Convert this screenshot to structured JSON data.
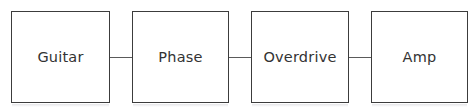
{
  "diagram": {
    "type": "signal-chain-flowchart",
    "canvas": {
      "width": 476,
      "height": 110,
      "background": "#ffffff"
    },
    "style": {
      "box_border_color": "#3c3c3c",
      "box_fill_color": "#ffffff",
      "connector_color": "#5a5a5a",
      "label_color": "#333333"
    },
    "nodes": [
      {
        "id": "guitar",
        "label": "Guitar"
      },
      {
        "id": "phase",
        "label": "Phase"
      },
      {
        "id": "overdrive",
        "label": "Overdrive"
      },
      {
        "id": "amp",
        "label": "Amp"
      }
    ],
    "connectors": [
      {
        "id": "connector-1",
        "from": "guitar",
        "to": "phase"
      },
      {
        "id": "connector-2",
        "from": "phase",
        "to": "overdrive"
      },
      {
        "id": "connector-3",
        "from": "overdrive",
        "to": "amp"
      }
    ]
  }
}
